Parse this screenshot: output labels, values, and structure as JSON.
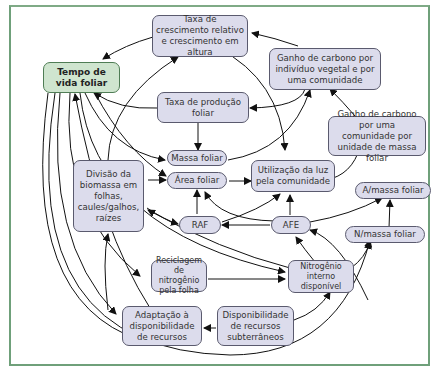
{
  "diagram": {
    "type": "concept-map",
    "nodes": {
      "tempo_vida": "Tempo de vida foliar",
      "taxa_crescimento": "Taxa de crescimento relativo e crescimento em altura",
      "ganho_individuo": "Ganho de carbono por indivíduo vegetal e por uma comunidade",
      "taxa_producao": "Taxa de produção foliar",
      "ganho_massa": "Ganho de carbono por uma comunidade por unidade de massa foliar",
      "massa_foliar": "Massa foliar",
      "divisao_biomassa": "Divisão da biomassa em folhas, caules/galhos, raízes",
      "area_foliar": "Área foliar",
      "utilizacao_luz": "Utilização da luz pela comunidade",
      "a_massa": "A/massa foliar",
      "raf": "RAF",
      "afe": "AFE",
      "n_massa": "N/massa foliar",
      "reciclagem": "Reciclagem de nitrogênio pela folha",
      "nitrogenio": "Nitrogênio interno disponível",
      "adaptacao": "Adaptação à disponibilidade de recursos",
      "disponibilidade": "Disponibilidade de recursos subterrâneos"
    },
    "colors": {
      "main_node_fill": "#cfe5cf",
      "node_fill": "#dcdcec",
      "frame_border": "#6fa07a",
      "edge": "#111111"
    }
  }
}
